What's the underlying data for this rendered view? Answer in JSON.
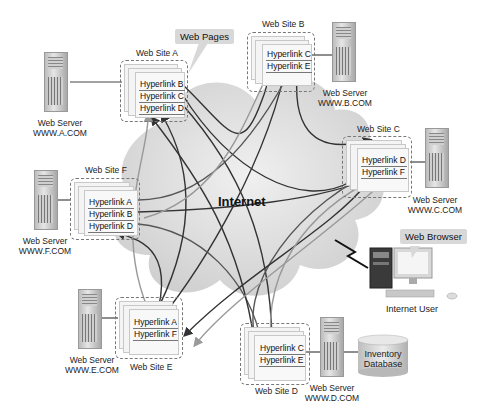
{
  "diagram": {
    "center_label": "Internet",
    "callouts": {
      "web_pages": "Web Pages",
      "web_browser": "Web Browser"
    },
    "sites": [
      {
        "id": "A",
        "title": "Web Site A",
        "server_label": "Web Server",
        "server_domain": "WWW.A.COM",
        "hyperlinks": [
          "Hyperlink B",
          "Hyperlink C",
          "Hyperlink D"
        ]
      },
      {
        "id": "B",
        "title": "Web Site B",
        "server_label": "Web Server",
        "server_domain": "WWW.B.COM",
        "hyperlinks": [
          "Hyperlink C",
          "Hyperlink E"
        ]
      },
      {
        "id": "C",
        "title": "Web Site C",
        "server_label": "Web Server",
        "server_domain": "WWW.C.COM",
        "hyperlinks": [
          "Hyperlink D",
          "Hyperlink F"
        ]
      },
      {
        "id": "D",
        "title": "Web Site D",
        "server_label": "Web Server",
        "server_domain": "WWW.D.COM",
        "hyperlinks": [
          "Hyperlink C",
          "Hyperlink E"
        ]
      },
      {
        "id": "E",
        "title": "Web Site E",
        "server_label": "Web Server",
        "server_domain": "WWW.E.COM",
        "hyperlinks": [
          "Hyperlink A",
          "Hyperlink F"
        ]
      },
      {
        "id": "F",
        "title": "Web Site F",
        "server_label": "Web Server",
        "server_domain": "WWW.F.COM",
        "hyperlinks": [
          "Hyperlink A",
          "Hyperlink B",
          "Hyperlink D"
        ]
      }
    ],
    "user": {
      "label": "Internet User"
    },
    "database": {
      "line1": "Inventory",
      "line2": "Database"
    },
    "colors": {
      "cloud": "#d9d9d9",
      "link_dark": "#333333",
      "link_light": "#9a9a9a",
      "dashed_border": "#777777",
      "callout_bg": "#d8d8d8"
    }
  }
}
